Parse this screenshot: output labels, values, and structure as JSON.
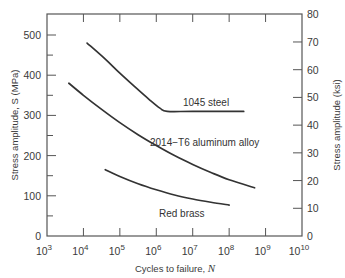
{
  "chart_data": {
    "type": "line",
    "title": "",
    "xlabel": "Cycles to failure, N",
    "xlabel_text": "Cycles to failure, ",
    "xlabel_var": "N",
    "ylabel": "Stress amplitude, S (MPa)",
    "ylabel_right": "Stress amplitude (ksi)",
    "xscale": "log",
    "xlim": [
      1000,
      10000000000
    ],
    "ylim": [
      0,
      552
    ],
    "ylim_right": [
      0,
      80
    ],
    "grid": false,
    "legend": "inline labels",
    "x_ticks": [
      {
        "base": "10",
        "exp": "3"
      },
      {
        "base": "10",
        "exp": "4"
      },
      {
        "base": "10",
        "exp": "5"
      },
      {
        "base": "10",
        "exp": "6"
      },
      {
        "base": "10",
        "exp": "7"
      },
      {
        "base": "10",
        "exp": "8"
      },
      {
        "base": "10",
        "exp": "9"
      },
      {
        "base": "10",
        "exp": "10"
      }
    ],
    "y_ticks_left": [
      "0",
      "100",
      "200",
      "300",
      "400",
      "500"
    ],
    "y_ticks_right": [
      "0",
      "10",
      "20",
      "30",
      "40",
      "50",
      "60",
      "70",
      "80"
    ],
    "series": [
      {
        "name": "1045 steel",
        "label": "1045 steel",
        "log10_N": [
          4.1,
          4.6,
          5.0,
          5.4,
          5.8,
          6.1,
          6.3,
          7.0,
          8.4
        ],
        "S_MPa": [
          480,
          440,
          405,
          372,
          340,
          318,
          310,
          310,
          310
        ]
      },
      {
        "name": "2014-T6 aluminum alloy",
        "label": "2014−T6 aluminum alloy",
        "log10_N": [
          3.6,
          4.0,
          4.5,
          5.0,
          5.5,
          6.0,
          6.5,
          7.0,
          7.5,
          8.0,
          8.7
        ],
        "S_MPa": [
          380,
          350,
          315,
          282,
          252,
          225,
          200,
          178,
          158,
          140,
          120
        ]
      },
      {
        "name": "Red brass",
        "label": "Red brass",
        "log10_N": [
          4.6,
          5.0,
          5.5,
          6.0,
          6.5,
          7.0,
          7.5,
          8.0
        ],
        "S_MPa": [
          165,
          148,
          130,
          115,
          102,
          92,
          84,
          77
        ]
      }
    ]
  }
}
